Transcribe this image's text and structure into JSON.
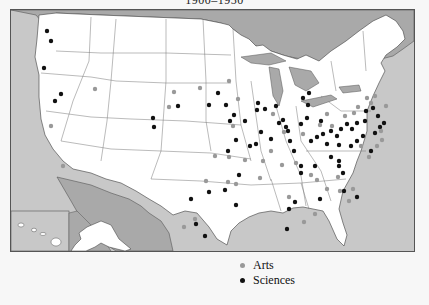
{
  "title": "1900–1950",
  "colors": {
    "ocean": "#c8c8c8",
    "foreign_land": "#a9a9a9",
    "us_land": "#ffffff",
    "border": "#555555",
    "arts": "#999999",
    "sciences": "#111111"
  },
  "legend": {
    "items": [
      {
        "label": "Arts",
        "color": "#999999"
      },
      {
        "label": "Sciences",
        "color": "#111111"
      }
    ]
  },
  "insets": [
    "Alaska",
    "Hawaii"
  ],
  "points": {
    "sciences": [
      [
        46,
        30
      ],
      [
        50,
        40
      ],
      [
        43,
        67
      ],
      [
        60,
        93
      ],
      [
        54,
        100
      ],
      [
        152,
        117
      ],
      [
        153,
        126
      ],
      [
        217,
        92
      ],
      [
        208,
        104
      ],
      [
        225,
        104
      ],
      [
        257,
        102
      ],
      [
        264,
        108
      ],
      [
        275,
        105
      ],
      [
        233,
        114
      ],
      [
        244,
        120
      ],
      [
        278,
        122
      ],
      [
        285,
        126
      ],
      [
        300,
        123
      ],
      [
        306,
        117
      ],
      [
        320,
        120
      ],
      [
        302,
        97
      ],
      [
        308,
        92
      ],
      [
        307,
        104
      ],
      [
        287,
        130
      ],
      [
        289,
        140
      ],
      [
        293,
        150
      ],
      [
        300,
        165
      ],
      [
        310,
        140
      ],
      [
        316,
        136
      ],
      [
        322,
        133
      ],
      [
        330,
        130
      ],
      [
        340,
        128
      ],
      [
        346,
        123
      ],
      [
        351,
        128
      ],
      [
        356,
        122
      ],
      [
        364,
        120
      ],
      [
        336,
        135
      ],
      [
        326,
        143
      ],
      [
        338,
        144
      ],
      [
        350,
        145
      ],
      [
        356,
        140
      ],
      [
        362,
        135
      ],
      [
        374,
        132
      ],
      [
        365,
        110
      ],
      [
        372,
        107
      ],
      [
        377,
        115
      ],
      [
        379,
        126
      ],
      [
        383,
        122
      ],
      [
        370,
        150
      ],
      [
        227,
        150
      ],
      [
        255,
        143
      ],
      [
        260,
        131
      ],
      [
        270,
        138
      ],
      [
        235,
        139
      ],
      [
        249,
        145
      ],
      [
        300,
        172
      ],
      [
        314,
        165
      ],
      [
        330,
        156
      ],
      [
        338,
        160
      ],
      [
        338,
        165
      ],
      [
        342,
        172
      ],
      [
        356,
        196
      ],
      [
        343,
        190
      ],
      [
        294,
        201
      ],
      [
        319,
        198
      ],
      [
        288,
        208
      ],
      [
        286,
        228
      ],
      [
        204,
        235
      ],
      [
        208,
        191
      ],
      [
        224,
        189
      ],
      [
        238,
        174
      ],
      [
        235,
        204
      ],
      [
        190,
        198
      ],
      [
        195,
        223
      ],
      [
        177,
        105
      ],
      [
        229,
        120
      ],
      [
        256,
        109
      ],
      [
        282,
        119
      ]
    ],
    "arts": [
      [
        94,
        88
      ],
      [
        199,
        87
      ],
      [
        228,
        80
      ],
      [
        237,
        98
      ],
      [
        232,
        125
      ],
      [
        272,
        113
      ],
      [
        283,
        131
      ],
      [
        302,
        133
      ],
      [
        319,
        124
      ],
      [
        326,
        113
      ],
      [
        331,
        125
      ],
      [
        344,
        115
      ],
      [
        353,
        112
      ],
      [
        357,
        106
      ],
      [
        366,
        97
      ],
      [
        370,
        102
      ],
      [
        374,
        95
      ],
      [
        360,
        145
      ],
      [
        368,
        156
      ],
      [
        376,
        145
      ],
      [
        381,
        139
      ],
      [
        380,
        130
      ],
      [
        385,
        105
      ],
      [
        270,
        150
      ],
      [
        262,
        160
      ],
      [
        281,
        164
      ],
      [
        295,
        162
      ],
      [
        310,
        174
      ],
      [
        316,
        179
      ],
      [
        326,
        188
      ],
      [
        337,
        176
      ],
      [
        339,
        190
      ],
      [
        352,
        188
      ],
      [
        348,
        200
      ],
      [
        314,
        213
      ],
      [
        288,
        196
      ],
      [
        303,
        221
      ],
      [
        228,
        156
      ],
      [
        244,
        159
      ],
      [
        227,
        181
      ],
      [
        205,
        180
      ],
      [
        194,
        218
      ],
      [
        183,
        226
      ],
      [
        50,
        125
      ],
      [
        62,
        165
      ],
      [
        168,
        106
      ],
      [
        173,
        91
      ],
      [
        235,
        183
      ],
      [
        259,
        177
      ],
      [
        214,
        155
      ]
    ]
  }
}
